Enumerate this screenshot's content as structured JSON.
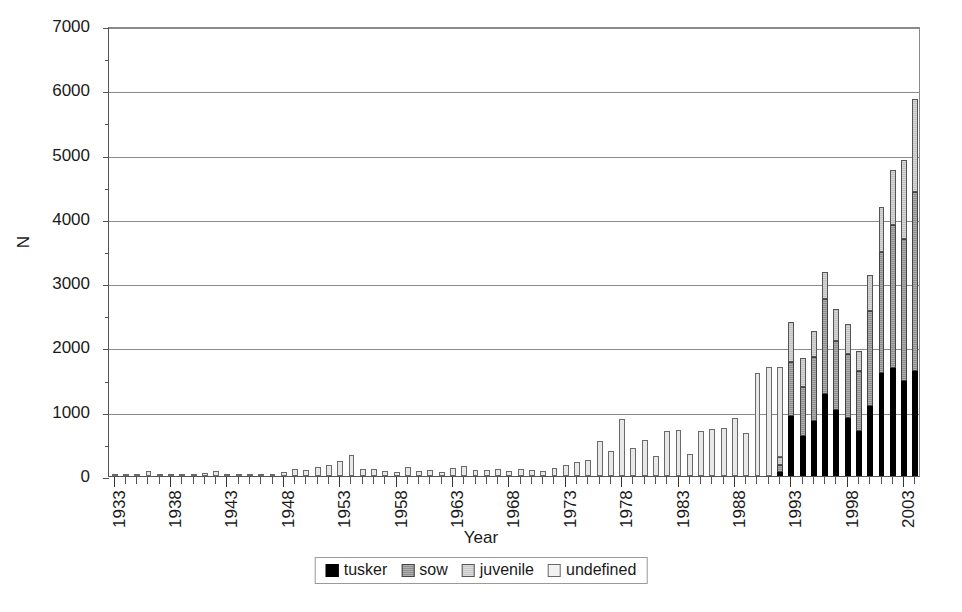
{
  "chart_data": {
    "type": "bar",
    "stacked": true,
    "title": "",
    "xlabel": "Year",
    "ylabel": "N",
    "ylim": [
      0,
      7000
    ],
    "ytick_step": 1000,
    "yminor_step": 500,
    "grid": true,
    "legend_position": "bottom",
    "xtick_label_step": 5,
    "xtick_labels": [
      "1933",
      "1938",
      "1943",
      "1948",
      "1953",
      "1958",
      "1963",
      "1968",
      "1973",
      "1978",
      "1983",
      "1988",
      "1993",
      "1998",
      "2003"
    ],
    "ytick_labels": [
      "0",
      "1000",
      "2000",
      "3000",
      "4000",
      "5000",
      "6000",
      "7000"
    ],
    "categories": [
      1933,
      1934,
      1935,
      1936,
      1937,
      1938,
      1939,
      1940,
      1941,
      1942,
      1943,
      1944,
      1945,
      1946,
      1947,
      1948,
      1949,
      1950,
      1951,
      1952,
      1953,
      1954,
      1955,
      1956,
      1957,
      1958,
      1959,
      1960,
      1961,
      1962,
      1963,
      1964,
      1965,
      1966,
      1967,
      1968,
      1969,
      1970,
      1971,
      1972,
      1973,
      1974,
      1975,
      1976,
      1977,
      1978,
      1979,
      1980,
      1981,
      1982,
      1983,
      1984,
      1985,
      1986,
      1987,
      1988,
      1989,
      1990,
      1991,
      1992,
      1993,
      1994,
      1995,
      1996,
      1997,
      1998,
      1999,
      2000,
      2001,
      2002,
      2003,
      2004
    ],
    "series": [
      {
        "name": "tusker",
        "color": "#000000",
        "values": [
          0,
          0,
          0,
          0,
          0,
          0,
          0,
          0,
          0,
          0,
          0,
          0,
          0,
          0,
          0,
          0,
          0,
          0,
          0,
          0,
          0,
          0,
          0,
          0,
          0,
          0,
          0,
          0,
          0,
          0,
          0,
          0,
          0,
          0,
          0,
          0,
          0,
          0,
          0,
          0,
          0,
          0,
          0,
          0,
          0,
          0,
          0,
          0,
          0,
          0,
          0,
          0,
          0,
          0,
          0,
          0,
          0,
          0,
          0,
          60,
          930,
          630,
          860,
          1270,
          1030,
          900,
          700,
          1090,
          1600,
          1680,
          1480,
          1630
        ]
      },
      {
        "name": "sow",
        "color": "#8f8f8f",
        "values": [
          0,
          0,
          0,
          0,
          0,
          0,
          0,
          0,
          0,
          0,
          0,
          0,
          0,
          0,
          0,
          0,
          0,
          0,
          0,
          0,
          0,
          0,
          0,
          0,
          0,
          0,
          0,
          0,
          0,
          0,
          0,
          0,
          0,
          0,
          0,
          0,
          0,
          0,
          0,
          0,
          0,
          0,
          0,
          0,
          0,
          0,
          0,
          0,
          0,
          0,
          0,
          0,
          0,
          0,
          0,
          0,
          0,
          0,
          0,
          110,
          850,
          760,
          990,
          1480,
          1070,
          1000,
          930,
          1470,
          1880,
          2220,
          2210,
          2790
        ]
      },
      {
        "name": "juvenile",
        "color": "#c2c2c2",
        "values": [
          0,
          0,
          0,
          0,
          0,
          0,
          0,
          0,
          0,
          0,
          0,
          0,
          0,
          0,
          0,
          0,
          0,
          0,
          0,
          0,
          0,
          0,
          0,
          0,
          0,
          0,
          0,
          0,
          0,
          0,
          0,
          0,
          0,
          0,
          0,
          0,
          0,
          0,
          0,
          0,
          0,
          0,
          0,
          0,
          0,
          0,
          0,
          0,
          0,
          0,
          0,
          0,
          0,
          0,
          0,
          0,
          0,
          0,
          0,
          130,
          610,
          440,
          400,
          420,
          500,
          460,
          310,
          570,
          700,
          860,
          1230,
          1450
        ]
      },
      {
        "name": "undefined",
        "color": "#e8e8e8",
        "values": [
          20,
          15,
          30,
          80,
          25,
          15,
          35,
          20,
          40,
          80,
          10,
          10,
          10,
          10,
          15,
          55,
          110,
          95,
          135,
          175,
          230,
          320,
          110,
          115,
          85,
          70,
          140,
          80,
          95,
          60,
          130,
          150,
          100,
          95,
          115,
          85,
          110,
          95,
          75,
          125,
          175,
          220,
          245,
          550,
          390,
          890,
          435,
          565,
          310,
          700,
          715,
          340,
          700,
          735,
          740,
          905,
          675,
          1600,
          1700,
          1400,
          0,
          0,
          0,
          0,
          0,
          0,
          0,
          0,
          0,
          0,
          0,
          0
        ]
      }
    ],
    "totals": [
      20,
      15,
      30,
      80,
      25,
      15,
      35,
      20,
      40,
      80,
      10,
      10,
      10,
      10,
      15,
      55,
      110,
      95,
      135,
      175,
      230,
      320,
      110,
      115,
      85,
      70,
      140,
      80,
      95,
      60,
      130,
      150,
      100,
      95,
      115,
      85,
      110,
      95,
      75,
      125,
      175,
      220,
      245,
      550,
      390,
      890,
      435,
      565,
      310,
      700,
      715,
      340,
      700,
      735,
      740,
      905,
      675,
      1600,
      1700,
      1700,
      2390,
      1830,
      2250,
      3170,
      2600,
      2360,
      1940,
      3130,
      4180,
      4740,
      4930,
      5870
    ]
  },
  "legend": {
    "items": [
      {
        "label": "tusker",
        "swatch": "tusker"
      },
      {
        "label": "sow",
        "swatch": "sow"
      },
      {
        "label": "juvenile",
        "swatch": "juvenile"
      },
      {
        "label": "undefined",
        "swatch": "undefined"
      }
    ]
  }
}
